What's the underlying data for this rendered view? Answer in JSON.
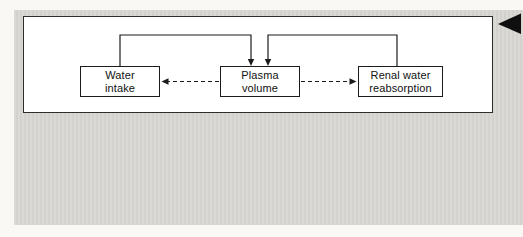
{
  "diagram": {
    "nodes": [
      {
        "id": "water-intake",
        "lines": [
          "Water",
          "intake"
        ]
      },
      {
        "id": "plasma-volume",
        "lines": [
          "Plasma",
          "volume"
        ]
      },
      {
        "id": "renal-water-reabsorption",
        "lines": [
          "Renal water",
          "reabsorption"
        ]
      }
    ],
    "edges": [
      {
        "from": "water-intake",
        "to": "plasma-volume",
        "style": "solid",
        "meaning": "increases"
      },
      {
        "from": "renal-water-reabsorption",
        "to": "plasma-volume",
        "style": "solid",
        "meaning": "increases"
      },
      {
        "from": "plasma-volume",
        "to": "water-intake",
        "style": "dashed",
        "meaning": "feedback"
      },
      {
        "from": "plasma-volume",
        "to": "renal-water-reabsorption",
        "style": "dashed",
        "meaning": "feedback"
      }
    ],
    "colors": {
      "figure_background": "#d8d7d4",
      "panel_background": "#ffffff",
      "line_color": "#1b1b1b",
      "marker_color": "#0f0f0f"
    }
  },
  "icons": {
    "corner_marker": "left-triangle-icon"
  }
}
